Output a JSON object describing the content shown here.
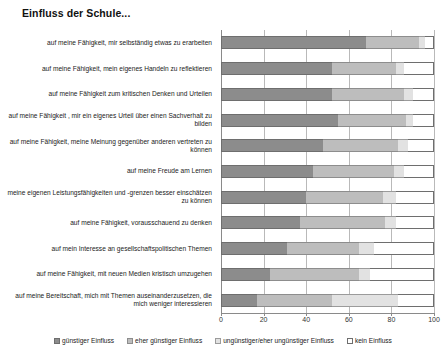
{
  "chart_data": {
    "type": "bar",
    "orientation": "horizontal",
    "stacked": true,
    "stacked_percent": true,
    "title": "Einfluss der Schule...",
    "xlabel": "",
    "ylabel": "",
    "xlim": [
      0,
      100
    ],
    "xticks": [
      0,
      20,
      40,
      60,
      80,
      100
    ],
    "grid": true,
    "legend_position": "bottom",
    "series": [
      {
        "name": "günstiger Einfluss",
        "values": [
          68,
          52,
          52,
          55,
          48,
          43,
          40,
          37,
          31,
          23,
          17
        ]
      },
      {
        "name": "eher günstiger Einfluss",
        "values": [
          25,
          30,
          34,
          32,
          35,
          38,
          36,
          40,
          34,
          42,
          35
        ]
      },
      {
        "name": "ungünstiger/eher ungünstiger Einfluss",
        "values": [
          3,
          4,
          4,
          3,
          5,
          5,
          6,
          5,
          7,
          5,
          31
        ]
      },
      {
        "name": "kein Einfluss",
        "values": [
          4,
          14,
          10,
          10,
          12,
          14,
          18,
          18,
          28,
          30,
          17
        ]
      }
    ],
    "categories": [
      "auf meine Fähigkeit, mir selbständig etwas zu erarbeiten",
      "auf meine Fähigkeit, mein eigenes Handeln zu reflektieren",
      "auf meine Fähigkeit zum kritischen Denken und Urteilen",
      "auf meine Fähigkeit , mir ein eigenes Urteil über einen Sachverhalt zu bilden",
      "auf meine Fähigkeit, meine Meinung gegenüber anderen vertreten zu können",
      "auf meine Freude am Lernen",
      "meine eigenen Leistungsfähigkeiten und -grenzen besser einschätzen zu können",
      "auf meine Fähigkeit, vorausschauend zu denken",
      "auf mein Interesse an gesellschaftspolitischen Themen",
      "auf meine Fähigkeit, mit neuen Medien kristisch umzugehen",
      "auf meine Bereitschaft, mich mit Themen auseinanderzusetzen, die mich weniger interessieren"
    ],
    "colors": {
      "series_0": "#8c8c8c",
      "series_1": "#bdbdbd",
      "series_2": "#e2e2e2",
      "series_3": "#ffffff",
      "axis": "#8a8a8a",
      "grid": "#b9b9b9"
    }
  }
}
